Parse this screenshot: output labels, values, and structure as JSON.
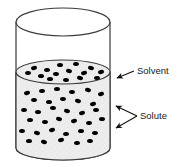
{
  "figure": {
    "background_color": "#ffffff",
    "width": 183,
    "height": 167
  },
  "labels": [
    {
      "id": "solvent",
      "text": "Solvent",
      "x": 137,
      "y": 71,
      "leader_from": [
        134,
        71
      ],
      "leader_to": [
        115,
        79
      ],
      "arrow_count": 1
    },
    {
      "id": "solute",
      "text": "Solute",
      "x": 140,
      "y": 116,
      "leader_from": [
        137,
        116
      ],
      "leader_to": [
        [
          112,
          105
        ],
        [
          112,
          129
        ]
      ],
      "arrow_count": 2
    }
  ],
  "container": {
    "name": "cylinder-beaker",
    "outline_color": "#3a3a3a",
    "outline_width": 1.2,
    "left_x": 16,
    "right_x": 110,
    "top_center_y": 22,
    "top_ellipse_ry": 14,
    "bottom_center_y": 148,
    "bottom_ellipse_ry": 12,
    "empty_fill": "#ffffff"
  },
  "liquid": {
    "name": "solvent-liquid",
    "fill_color": "#ededed",
    "surface_center_y": 72,
    "surface_ellipse_ry": 12,
    "outline_color": "#3a3a3a",
    "fill_fraction_percent": 57,
    "texture": "speckled-light-gray"
  },
  "solute_particles": {
    "name": "solute-dots",
    "color": "#000000",
    "shape": "ellipse",
    "rx": 3.0,
    "ry": 2.0,
    "count": 45,
    "points": [
      [
        34,
        68
      ],
      [
        47,
        70
      ],
      [
        60,
        65
      ],
      [
        76,
        64
      ],
      [
        91,
        68
      ],
      [
        101,
        72
      ],
      [
        28,
        73
      ],
      [
        41,
        76
      ],
      [
        56,
        74
      ],
      [
        69,
        71
      ],
      [
        84,
        73
      ],
      [
        97,
        78
      ],
      [
        50,
        79
      ],
      [
        66,
        80
      ],
      [
        80,
        78
      ],
      [
        27,
        93
      ],
      [
        42,
        91
      ],
      [
        57,
        89
      ],
      [
        72,
        92
      ],
      [
        88,
        90
      ],
      [
        101,
        94
      ],
      [
        34,
        100
      ],
      [
        49,
        102
      ],
      [
        63,
        99
      ],
      [
        78,
        101
      ],
      [
        93,
        104
      ],
      [
        24,
        110
      ],
      [
        38,
        112
      ],
      [
        53,
        108
      ],
      [
        67,
        111
      ],
      [
        82,
        113
      ],
      [
        96,
        110
      ],
      [
        30,
        120
      ],
      [
        45,
        122
      ],
      [
        59,
        119
      ],
      [
        74,
        121
      ],
      [
        89,
        123
      ],
      [
        102,
        119
      ],
      [
        22,
        131
      ],
      [
        37,
        133
      ],
      [
        52,
        130
      ],
      [
        66,
        134
      ],
      [
        81,
        131
      ],
      [
        95,
        133
      ],
      [
        44,
        142
      ],
      [
        61,
        140
      ],
      [
        77,
        143
      ],
      [
        29,
        141
      ],
      [
        90,
        141
      ]
    ]
  }
}
